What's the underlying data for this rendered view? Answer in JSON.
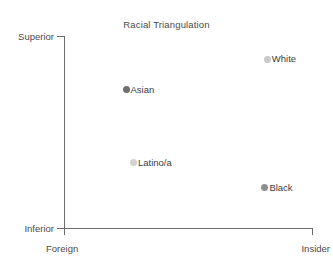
{
  "chart_data": {
    "type": "scatter",
    "title": "Racial Triangulation",
    "xlabel": "",
    "ylabel": "",
    "grid": false,
    "legend": "none",
    "x_axis": {
      "min_tick_label": "Foreign",
      "max_tick_label": "Insider",
      "ticks": [
        "Foreign",
        "Insider"
      ]
    },
    "y_axis": {
      "min_tick_label": "Inferior",
      "max_tick_label": "Superior",
      "ticks": [
        "Inferior",
        "Superior"
      ]
    },
    "xlim": [
      0,
      1
    ],
    "ylim": [
      0,
      1
    ],
    "points": [
      {
        "label": "White",
        "x": 0.82,
        "y": 0.88,
        "color": "#c9c9c9"
      },
      {
        "label": "Asian",
        "x": 0.25,
        "y": 0.72,
        "color": "#6f6f6f"
      },
      {
        "label": "Latino/a",
        "x": 0.28,
        "y": 0.34,
        "color": "#d2d2d2"
      },
      {
        "label": "Black",
        "x": 0.81,
        "y": 0.21,
        "color": "#8f8f8f"
      }
    ]
  },
  "chart": {
    "title": "Racial Triangulation",
    "axis": {
      "y_top": "Superior",
      "y_bottom": "Inferior",
      "x_left": "Foreign",
      "x_right": "Insider"
    },
    "points": [
      {
        "label": "White"
      },
      {
        "label": "Asian"
      },
      {
        "label": "Latino/a"
      },
      {
        "label": "Black"
      }
    ]
  }
}
